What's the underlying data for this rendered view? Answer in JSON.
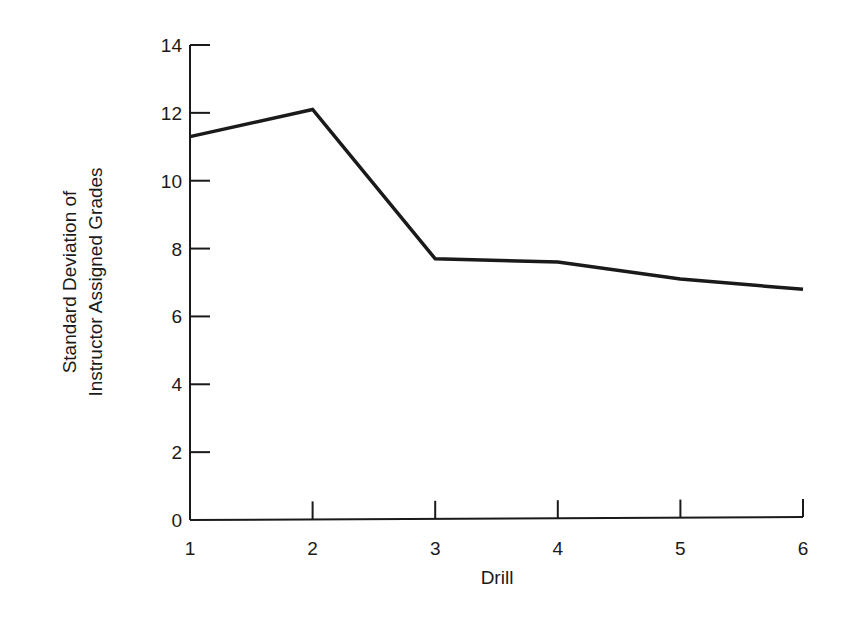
{
  "chart_data": {
    "type": "line",
    "title": "",
    "xlabel": "Drill",
    "ylabel": [
      "Standard Deviation of",
      "Instructor Assigned Grades"
    ],
    "x": [
      1,
      2,
      3,
      4,
      5,
      6
    ],
    "x_tick_labels": [
      "1",
      "2",
      "3",
      "4",
      "5",
      "6"
    ],
    "y_ticks": [
      0,
      2,
      4,
      6,
      8,
      10,
      12,
      14
    ],
    "y_tick_labels": [
      "0",
      "2",
      "4",
      "6",
      "8",
      "10",
      "12",
      "14"
    ],
    "series": [
      {
        "name": "Standard Deviation",
        "values": [
          11.3,
          12.1,
          7.7,
          7.6,
          7.1,
          6.8
        ]
      }
    ],
    "xlim": [
      1,
      6
    ],
    "ylim": [
      0,
      14
    ],
    "grid": false,
    "legend": "none",
    "line_color": "#1a1a1a"
  }
}
